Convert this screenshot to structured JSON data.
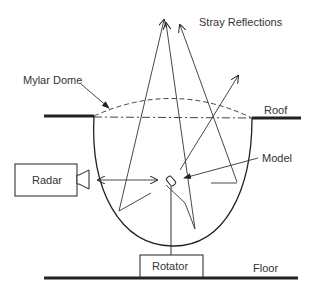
{
  "diagram": {
    "labels": {
      "stray_reflections": "Stray Reflections",
      "mylar_dome": "Mylar Dome",
      "roof": "Roof",
      "model": "Model",
      "radar": "Radar",
      "rotator": "Rotator",
      "floor": "Floor"
    },
    "colors": {
      "line": "#222222",
      "text": "#333333",
      "background": "#ffffff"
    }
  }
}
